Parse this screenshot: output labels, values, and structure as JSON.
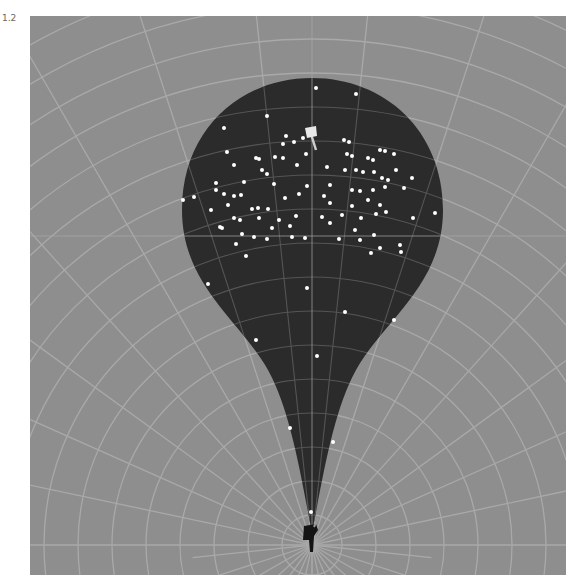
{
  "label": {
    "version": "1.2"
  },
  "colors": {
    "field": "#8e8e8e",
    "grid": "#a9a9a9",
    "cone": "#2b2b2b",
    "dot": "#ffffff",
    "pin": "#dcdcdc"
  },
  "chart_data": {
    "type": "scatter",
    "title": "",
    "origin": [
      312,
      545
    ],
    "target_flag": [
      311,
      135
    ],
    "grid": {
      "arcs": "concentric",
      "radial_lines": true,
      "crosshair": [
        312,
        236
      ]
    },
    "points": [
      [
        316,
        88
      ],
      [
        356,
        94
      ],
      [
        267,
        116
      ],
      [
        286,
        136
      ],
      [
        224,
        128
      ],
      [
        283,
        144
      ],
      [
        294,
        142
      ],
      [
        227,
        152
      ],
      [
        256,
        158
      ],
      [
        283,
        158
      ],
      [
        303,
        138
      ],
      [
        344,
        140
      ],
      [
        349,
        142
      ],
      [
        380,
        150
      ],
      [
        385,
        151
      ],
      [
        216,
        183
      ],
      [
        259,
        159
      ],
      [
        275,
        157
      ],
      [
        306,
        154
      ],
      [
        347,
        154
      ],
      [
        352,
        156
      ],
      [
        368,
        158
      ],
      [
        373,
        160
      ],
      [
        394,
        154
      ],
      [
        412,
        178
      ],
      [
        234,
        165
      ],
      [
        262,
        170
      ],
      [
        297,
        165
      ],
      [
        327,
        167
      ],
      [
        345,
        170
      ],
      [
        356,
        170
      ],
      [
        363,
        172
      ],
      [
        374,
        172
      ],
      [
        382,
        178
      ],
      [
        388,
        180
      ],
      [
        396,
        170
      ],
      [
        224,
        194
      ],
      [
        194,
        197
      ],
      [
        216,
        190
      ],
      [
        244,
        182
      ],
      [
        267,
        174
      ],
      [
        274,
        184
      ],
      [
        307,
        186
      ],
      [
        330,
        185
      ],
      [
        352,
        190
      ],
      [
        360,
        191
      ],
      [
        373,
        190
      ],
      [
        385,
        187
      ],
      [
        404,
        188
      ],
      [
        211,
        210
      ],
      [
        228,
        205
      ],
      [
        234,
        196
      ],
      [
        241,
        195
      ],
      [
        252,
        209
      ],
      [
        258,
        208
      ],
      [
        268,
        209
      ],
      [
        285,
        198
      ],
      [
        299,
        194
      ],
      [
        324,
        196
      ],
      [
        330,
        203
      ],
      [
        352,
        206
      ],
      [
        368,
        200
      ],
      [
        380,
        205
      ],
      [
        413,
        218
      ],
      [
        220,
        227
      ],
      [
        234,
        218
      ],
      [
        240,
        220
      ],
      [
        259,
        218
      ],
      [
        279,
        220
      ],
      [
        296,
        216
      ],
      [
        322,
        217
      ],
      [
        342,
        215
      ],
      [
        361,
        218
      ],
      [
        376,
        214
      ],
      [
        386,
        212
      ],
      [
        435,
        213
      ],
      [
        222,
        228
      ],
      [
        242,
        234
      ],
      [
        272,
        228
      ],
      [
        290,
        226
      ],
      [
        330,
        223
      ],
      [
        355,
        230
      ],
      [
        374,
        235
      ],
      [
        254,
        237
      ],
      [
        267,
        239
      ],
      [
        292,
        237
      ],
      [
        305,
        238
      ],
      [
        339,
        239
      ],
      [
        360,
        240
      ],
      [
        380,
        248
      ],
      [
        400,
        245
      ],
      [
        236,
        244
      ],
      [
        246,
        256
      ],
      [
        371,
        253
      ],
      [
        401,
        252
      ],
      [
        183,
        200
      ],
      [
        208,
        284
      ],
      [
        307,
        288
      ],
      [
        345,
        312
      ],
      [
        394,
        320
      ],
      [
        256,
        340
      ],
      [
        317,
        356
      ],
      [
        290,
        428
      ],
      [
        333,
        442
      ],
      [
        311,
        512
      ]
    ],
    "xlabel": "",
    "ylabel": "",
    "legend": []
  }
}
